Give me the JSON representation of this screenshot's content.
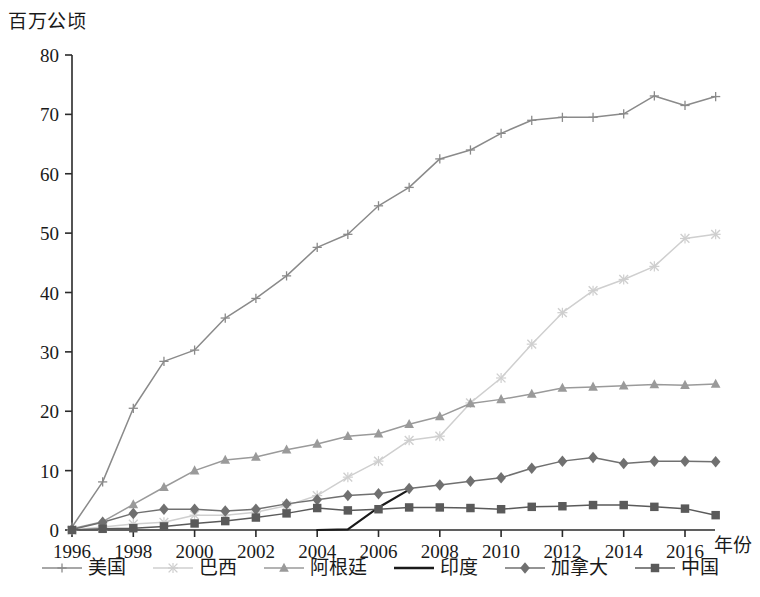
{
  "chart_data": {
    "type": "line",
    "title": "",
    "ylabel": "百万公顷",
    "xlabel": "年份",
    "xlim": [
      1996,
      2017
    ],
    "ylim": [
      0,
      80
    ],
    "yticks": [
      0,
      10,
      20,
      30,
      40,
      50,
      60,
      70,
      80
    ],
    "xticks": [
      1996,
      1998,
      2000,
      2002,
      2004,
      2006,
      2008,
      2010,
      2012,
      2014,
      2016
    ],
    "xtick_labels": [
      "1996",
      "1998",
      "2000",
      "2002",
      "2004",
      "2006",
      "2008",
      "2010",
      "2012",
      "2014",
      "2016"
    ],
    "ytick_labels": [
      "0",
      "10",
      "20",
      "30",
      "40",
      "50",
      "60",
      "70",
      "80"
    ],
    "grid": false,
    "legend_position": "bottom",
    "x": [
      1996,
      1997,
      1998,
      1999,
      2000,
      2001,
      2002,
      2003,
      2004,
      2005,
      2006,
      2007,
      2008,
      2009,
      2010,
      2011,
      2012,
      2013,
      2014,
      2015,
      2016,
      2017
    ],
    "series": [
      {
        "name": "美国",
        "marker": "plus",
        "color": "#8a8a8a",
        "x": [
          1996,
          1997,
          1998,
          1999,
          2000,
          2001,
          2002,
          2003,
          2004,
          2005,
          2006,
          2007,
          2008,
          2009,
          2010,
          2011,
          2012,
          2013,
          2014,
          2015,
          2016,
          2017
        ],
        "values": [
          0.5,
          8.1,
          20.5,
          28.4,
          30.3,
          35.7,
          39.0,
          42.8,
          47.6,
          49.8,
          54.6,
          57.7,
          62.5,
          64.0,
          66.8,
          69.0,
          69.5,
          69.5,
          70.1,
          73.1,
          71.5,
          73.0
        ]
      },
      {
        "name": "巴西",
        "marker": "asterisk",
        "color": "#cfcfcf",
        "x": [
          1996,
          1997,
          1998,
          1999,
          2000,
          2001,
          2002,
          2003,
          2004,
          2005,
          2006,
          2007,
          2008,
          2009,
          2010,
          2011,
          2012,
          2013,
          2014,
          2015,
          2016,
          2017
        ],
        "values": [
          0.0,
          0.5,
          1.0,
          1.3,
          2.5,
          2.5,
          3.0,
          4.1,
          5.8,
          8.9,
          11.6,
          15.1,
          15.8,
          21.4,
          25.6,
          31.3,
          36.6,
          40.3,
          42.2,
          44.4,
          49.1,
          49.8
        ]
      },
      {
        "name": "阿根廷",
        "marker": "triangle",
        "color": "#9a9a9a",
        "x": [
          1996,
          1997,
          1998,
          1999,
          2000,
          2001,
          2002,
          2003,
          2004,
          2005,
          2006,
          2007,
          2008,
          2009,
          2010,
          2011,
          2012,
          2013,
          2014,
          2015,
          2016,
          2017
        ],
        "values": [
          0.2,
          1.4,
          4.3,
          7.2,
          10.0,
          11.8,
          12.3,
          13.5,
          14.5,
          15.8,
          16.2,
          17.8,
          19.1,
          21.3,
          22.0,
          22.9,
          23.9,
          24.1,
          24.3,
          24.5,
          24.4,
          24.6
        ]
      },
      {
        "name": "印度",
        "marker": "none",
        "color": "#1a1a1a",
        "x": [
          2004,
          2005,
          2006,
          2007
        ],
        "values": [
          0.0,
          0.1,
          3.8,
          6.8
        ]
      },
      {
        "name": "加拿大",
        "marker": "diamond",
        "color": "#707070",
        "x": [
          1996,
          1997,
          1998,
          1999,
          2000,
          2001,
          2002,
          2003,
          2004,
          2005,
          2006,
          2007,
          2008,
          2009,
          2010,
          2011,
          2012,
          2013,
          2014,
          2015,
          2016,
          2017
        ],
        "values": [
          0.1,
          1.3,
          2.8,
          3.5,
          3.5,
          3.2,
          3.5,
          4.4,
          5.1,
          5.8,
          6.1,
          7.0,
          7.6,
          8.2,
          8.8,
          10.4,
          11.6,
          12.2,
          11.2,
          11.6,
          11.6,
          11.5
        ]
      },
      {
        "name": "中国",
        "marker": "square",
        "color": "#5a5a5a",
        "x": [
          1996,
          1997,
          1998,
          1999,
          2000,
          2001,
          2002,
          2003,
          2004,
          2005,
          2006,
          2007,
          2008,
          2009,
          2010,
          2011,
          2012,
          2013,
          2014,
          2015,
          2016,
          2017
        ],
        "values": [
          0.0,
          0.2,
          0.3,
          0.6,
          1.1,
          1.5,
          2.1,
          2.8,
          3.7,
          3.3,
          3.5,
          3.8,
          3.8,
          3.7,
          3.5,
          3.9,
          4.0,
          4.2,
          4.2,
          3.9,
          3.6,
          2.5
        ]
      }
    ]
  },
  "axis": {
    "y_title": "百万公顷",
    "x_title": "年份"
  },
  "legend": {
    "items": [
      {
        "label": "美国",
        "marker": "plus-marker",
        "color": "#8a8a8a"
      },
      {
        "label": "巴西",
        "marker": "asterisk-marker",
        "color": "#cfcfcf"
      },
      {
        "label": "阿根廷",
        "marker": "triangle-marker",
        "color": "#9a9a9a"
      },
      {
        "label": "印度",
        "marker": "line-marker",
        "color": "#1a1a1a"
      },
      {
        "label": "加拿大",
        "marker": "diamond-marker",
        "color": "#707070"
      },
      {
        "label": "中国",
        "marker": "square-marker",
        "color": "#5a5a5a"
      }
    ]
  }
}
